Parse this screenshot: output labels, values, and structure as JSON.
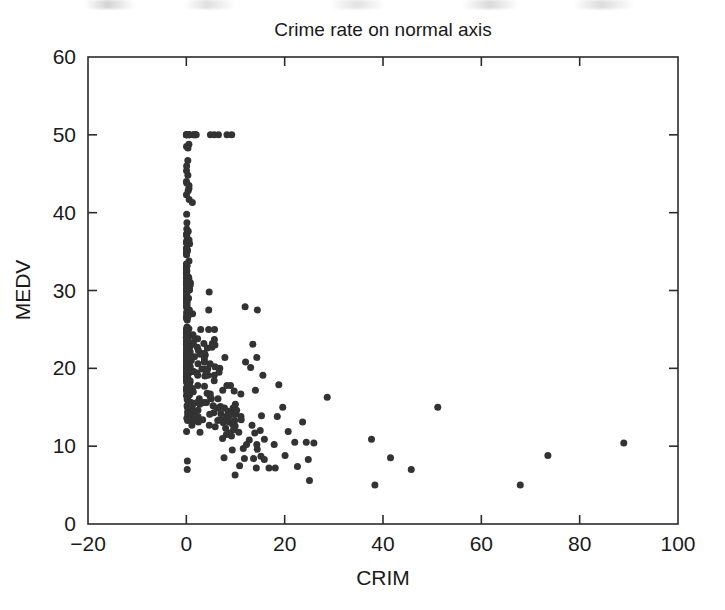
{
  "figure": {
    "name": "crime-rate-scatter-figure",
    "width": 725,
    "height": 610,
    "background": "#ffffff",
    "marker_color": "#333333",
    "axis_color": "#2b2b2b"
  },
  "chart_data": {
    "type": "scatter",
    "title": "Crime rate on normal axis",
    "xlabel": "CRIM",
    "ylabel": "MEDV",
    "xlim": [
      -20,
      100
    ],
    "ylim": [
      0,
      60
    ],
    "xticks": [
      -20,
      0,
      20,
      40,
      60,
      80,
      100
    ],
    "yticks": [
      0,
      10,
      20,
      30,
      40,
      50,
      60
    ],
    "xtick_labels": [
      "−20",
      "0",
      "20",
      "40",
      "60",
      "80",
      "100"
    ],
    "ytick_labels": [
      "0",
      "10",
      "20",
      "30",
      "40",
      "50",
      "60"
    ],
    "grid": false,
    "legend": null,
    "marker": "filled-circle",
    "marker_size_px": 7,
    "n_points": 506,
    "x": [
      0.00632,
      0.02731,
      0.02729,
      0.03237,
      0.06905,
      0.02985,
      0.08829,
      0.14455,
      0.21124,
      0.17004,
      0.22489,
      0.11747,
      0.09378,
      0.62976,
      0.63796,
      0.62739,
      1.05393,
      0.7842,
      0.8027,
      0.7258,
      1.25179,
      0.85204,
      1.23247,
      0.98843,
      0.75026,
      0.84054,
      0.67191,
      0.95577,
      0.77299,
      1.00245,
      1.13081,
      1.35472,
      1.38799,
      1.15172,
      1.61282,
      0.06417,
      0.09744,
      0.08014,
      0.17505,
      0.02763,
      0.03359,
      0.12744,
      0.1415,
      0.15936,
      0.12269,
      0.17142,
      0.18836,
      0.22927,
      0.25387,
      0.21977,
      0.08873,
      0.04337,
      0.0536,
      0.04981,
      0.0136,
      0.01311,
      0.02055,
      0.01432,
      0.15445,
      0.10328,
      0.14932,
      0.17171,
      0.11027,
      0.1265,
      0.01951,
      0.03584,
      0.04379,
      0.05789,
      0.13554,
      0.12816,
      0.08826,
      0.15876,
      0.09164,
      0.19539,
      0.07896,
      0.09512,
      0.10153,
      0.08707,
      0.05646,
      0.08387,
      0.04113,
      0.04462,
      0.03659,
      0.03551,
      0.05059,
      0.05735,
      0.05188,
      0.07151,
      0.0566,
      0.05302,
      0.04684,
      0.03932,
      0.04203,
      0.02875,
      0.04294,
      0.12204,
      0.11504,
      0.12083,
      0.08187,
      0.0686,
      0.14866,
      0.11432,
      0.22876,
      0.21161,
      0.1396,
      0.13262,
      0.1712,
      0.13117,
      0.12802,
      0.26363,
      0.10793,
      0.10084,
      0.12329,
      0.22212,
      0.14231,
      0.17134,
      0.13158,
      0.15098,
      0.13058,
      0.14476,
      0.06899,
      0.07165,
      0.09299,
      0.15038,
      0.09849,
      0.16902,
      0.38735,
      0.25915,
      0.32543,
      0.88125,
      0.34006,
      1.19294,
      0.59005,
      0.32982,
      0.97617,
      0.55778,
      0.32264,
      0.35233,
      0.2498,
      0.54452,
      0.2909,
      1.62864,
      3.32105,
      4.0974,
      2.77974,
      2.37934,
      2.15505,
      2.36862,
      2.33099,
      2.73397,
      1.6566,
      1.49632,
      1.12658,
      2.14918,
      1.41385,
      3.53501,
      2.44668,
      1.22358,
      1.34284,
      1.42502,
      1.27346,
      1.46336,
      1.83377,
      1.51902,
      2.24236,
      2.924,
      2.01019,
      1.80028,
      2.3004,
      2.44953,
      1.20742,
      2.3139,
      0.13914,
      0.09178,
      0.08447,
      0.06664,
      0.07022,
      0.05425,
      0.06642,
      0.0578,
      0.06588,
      0.06888,
      0.09103,
      0.10008,
      0.08308,
      0.06047,
      0.05602,
      0.07875,
      0.12579,
      0.0837,
      0.09068,
      0.06911,
      0.08664,
      0.02187,
      0.01439,
      0.01381,
      0.04011,
      0.04666,
      0.03768,
      0.0315,
      0.01778,
      0.03445,
      0.02177,
      0.0351,
      0.02009,
      0.13642,
      0.22969,
      0.25199,
      0.13587,
      0.43571,
      0.17446,
      0.37578,
      0.21719,
      0.14052,
      0.28955,
      0.19802,
      0.0456,
      0.07013,
      0.11069,
      0.11425,
      0.35809,
      0.40771,
      0.62356,
      0.6147,
      0.31533,
      0.52693,
      0.38214,
      0.41238,
      0.29819,
      0.44178,
      0.537,
      0.46296,
      0.57529,
      0.33147,
      0.44791,
      0.33045,
      0.52058,
      0.51183,
      0.08244,
      0.09252,
      0.11329,
      0.10612,
      0.1029,
      0.12757,
      0.20608,
      0.19133,
      0.33983,
      0.19657,
      0.16439,
      0.19073,
      0.1403,
      0.21409,
      0.08221,
      0.36894,
      0.04819,
      0.03548,
      0.01538,
      0.61154,
      0.66351,
      0.65665,
      0.54011,
      0.53412,
      0.52014,
      0.82526,
      0.55007,
      0.76162,
      0.7857,
      0.57834,
      0.5405,
      0.09065,
      0.29916,
      0.16211,
      0.1146,
      0.22188,
      0.05644,
      0.09604,
      0.10469,
      0.06127,
      0.07978,
      0.21038,
      0.03578,
      0.03705,
      0.06129,
      0.01501,
      0.00906,
      0.01096,
      0.01965,
      0.03871,
      0.0459,
      0.04297,
      0.03502,
      0.07886,
      0.03615,
      0.08265,
      0.08199,
      0.12932,
      0.05372,
      0.14103,
      0.06466,
      0.05561,
      0.04417,
      0.03537,
      0.09266,
      0.1,
      0.05515,
      0.05479,
      0.07503,
      0.04932,
      0.49298,
      0.3494,
      2.63548,
      0.79041,
      0.26169,
      0.26938,
      0.3692,
      0.25356,
      0.31827,
      0.24522,
      0.40202,
      0.47547,
      0.1676,
      0.18159,
      0.35114,
      0.28392,
      0.34109,
      0.19186,
      0.30347,
      0.24103,
      0.06617,
      0.06724,
      0.04544,
      0.05023,
      0.03466,
      0.05083,
      0.03738,
      0.03961,
      0.03427,
      0.03041,
      0.03306,
      0.05497,
      0.06151,
      0.01301,
      0.02498,
      0.02543,
      0.03049,
      0.03113,
      0.06162,
      0.0187,
      0.01501,
      0.02899,
      0.06211,
      0.0795,
      0.07244,
      0.01709,
      0.04301,
      0.10659,
      8.98296,
      3.8497,
      5.20177,
      4.26131,
      4.54192,
      3.83684,
      3.67822,
      4.22239,
      3.47428,
      4.55587,
      3.69695,
      13.5222,
      4.89822,
      5.66998,
      6.53876,
      9.2323,
      8.26725,
      11.1081,
      18.4982,
      19.6091,
      15.288,
      9.82349,
      23.6482,
      17.8667,
      88.9762,
      15.8744,
      9.18702,
      7.99248,
      20.0849,
      16.8118,
      24.3938,
      22.5971,
      14.3337,
      8.15174,
      6.96215,
      5.29305,
      11.5779,
      8.64476,
      13.3598,
      8.71675,
      5.87205,
      7.67202,
      38.3518,
      9.91655,
      25.0461,
      14.2362,
      9.59571,
      24.8017,
      41.5292,
      67.9208,
      20.7162,
      11.9511,
      7.40389,
      14.4383,
      51.1358,
      14.0507,
      18.811,
      28.6558,
      45.7461,
      18.0846,
      10.8342,
      25.9406,
      73.5341,
      11.8123,
      11.0874,
      7.02259,
      12.0482,
      7.05042,
      8.79212,
      15.8603,
      12.2472,
      37.6619,
      7.36711,
      9.33889,
      8.49213,
      10.0623,
      6.44405,
      5.58107,
      13.9134,
      11.1604,
      14.4208,
      15.1772,
      13.6781,
      9.39063,
      22.0511,
      9.72418,
      5.66637,
      9.96654,
      12.8023,
      10.6718,
      6.28807,
      9.92485,
      9.32909,
      7.52601,
      6.71772,
      5.44114,
      5.09017,
      8.24809,
      9.51363,
      4.75237,
      4.66883,
      8.20058,
      7.75223,
      6.80117,
      4.81213,
      3.69311,
      6.65492,
      5.82115,
      7.83932,
      3.1636,
      3.77498,
      4.42228,
      15.5757,
      13.0751,
      4.34879,
      4.03841,
      3.56868,
      4.64689,
      8.05579,
      6.39312,
      4.87141,
      15.0234,
      10.233,
      14.3337,
      5.82401,
      5.70818,
      5.73116,
      2.81838,
      2.37857,
      3.67367,
      5.69175,
      4.83567,
      0.15086,
      0.18337,
      0.20746,
      0.10574,
      0.11132,
      0.17331,
      0.27957,
      0.17899,
      0.2896,
      0.26838,
      0.23912,
      0.17783,
      0.22438,
      0.06263,
      0.04527,
      0.06076,
      0.10959,
      0.04741
    ],
    "y": [
      24.0,
      21.6,
      34.7,
      33.4,
      36.2,
      28.7,
      22.9,
      27.1,
      16.5,
      18.9,
      15.0,
      18.9,
      21.7,
      20.4,
      18.2,
      19.9,
      23.1,
      17.5,
      20.2,
      18.2,
      13.6,
      19.6,
      15.2,
      14.5,
      15.6,
      13.9,
      16.6,
      14.8,
      18.4,
      21.0,
      12.7,
      14.5,
      13.2,
      13.1,
      13.5,
      18.9,
      20.0,
      21.0,
      24.7,
      30.8,
      34.9,
      26.6,
      25.3,
      24.7,
      21.2,
      19.3,
      20.0,
      16.6,
      14.4,
      19.4,
      19.7,
      20.5,
      25.0,
      23.4,
      18.9,
      35.4,
      24.7,
      31.6,
      23.3,
      19.6,
      18.7,
      16.0,
      22.2,
      25.0,
      33.0,
      23.5,
      19.4,
      22.0,
      17.4,
      20.9,
      24.2,
      21.7,
      22.8,
      23.4,
      24.1,
      21.4,
      20.0,
      20.8,
      21.2,
      20.3,
      28.0,
      23.9,
      24.8,
      22.9,
      23.9,
      26.6,
      22.5,
      22.2,
      23.6,
      28.7,
      22.6,
      22.0,
      22.9,
      25.0,
      20.6,
      28.4,
      21.4,
      38.7,
      43.8,
      33.2,
      27.5,
      26.5,
      18.6,
      19.3,
      20.1,
      19.5,
      19.5,
      20.4,
      19.8,
      19.4,
      21.7,
      22.8,
      18.8,
      18.7,
      18.5,
      18.3,
      21.2,
      19.2,
      20.4,
      19.3,
      22.0,
      20.3,
      20.5,
      17.3,
      18.8,
      21.4,
      15.7,
      16.2,
      18.0,
      14.3,
      19.2,
      19.6,
      23.0,
      18.4,
      15.6,
      18.1,
      17.4,
      17.1,
      13.3,
      17.8,
      14.0,
      14.4,
      13.4,
      15.6,
      11.8,
      13.8,
      15.6,
      14.6,
      17.8,
      15.4,
      21.5,
      19.6,
      15.3,
      19.4,
      17.0,
      15.6,
      13.1,
      41.3,
      24.3,
      23.3,
      27.0,
      50.0,
      50.0,
      50.0,
      22.7,
      25.0,
      50.0,
      23.8,
      23.8,
      22.3,
      17.4,
      19.1,
      23.1,
      23.6,
      22.6,
      29.4,
      23.2,
      24.6,
      29.9,
      37.2,
      39.8,
      36.2,
      37.9,
      32.5,
      26.4,
      29.6,
      50.0,
      32.0,
      29.8,
      34.9,
      37.0,
      30.5,
      36.4,
      31.1,
      29.1,
      50.0,
      33.3,
      30.3,
      34.6,
      34.9,
      32.9,
      24.1,
      42.3,
      48.5,
      50.0,
      22.6,
      24.4,
      22.5,
      24.4,
      20.0,
      21.7,
      19.3,
      22.4,
      28.1,
      23.7,
      25.0,
      23.3,
      28.7,
      21.5,
      23.0,
      26.7,
      21.7,
      27.5,
      30.1,
      44.8,
      50.0,
      37.6,
      31.6,
      46.7,
      31.5,
      24.3,
      31.7,
      41.7,
      48.3,
      29.0,
      24.0,
      25.1,
      31.5,
      23.7,
      23.3,
      22.0,
      20.1,
      22.2,
      23.7,
      17.6,
      18.5,
      24.3,
      20.5,
      24.5,
      26.2,
      24.4,
      24.8,
      29.6,
      42.8,
      21.9,
      20.9,
      44.0,
      50.0,
      36.0,
      30.1,
      33.8,
      43.1,
      48.8,
      31.0,
      36.5,
      22.8,
      30.7,
      50.0,
      43.5,
      20.7,
      21.1,
      25.2,
      24.4,
      35.2,
      32.4,
      32.0,
      33.2,
      33.1,
      29.1,
      35.1,
      45.4,
      35.4,
      46.0,
      50.0,
      32.2,
      22.0,
      20.1,
      23.2,
      22.3,
      24.8,
      28.5,
      37.3,
      27.9,
      23.9,
      21.7,
      28.6,
      27.1,
      20.3,
      22.5,
      29.0,
      24.8,
      22.0,
      26.4,
      33.1,
      36.1,
      28.4,
      33.4,
      28.2,
      22.8,
      20.3,
      16.1,
      22.1,
      19.4,
      21.6,
      23.8,
      16.2,
      17.8,
      19.8,
      23.1,
      21.0,
      23.8,
      23.1,
      20.4,
      18.5,
      25.0,
      24.6,
      23.0,
      22.2,
      19.3,
      22.6,
      19.8,
      17.1,
      19.4,
      22.2,
      20.7,
      21.1,
      19.5,
      18.5,
      20.6,
      19.0,
      18.7,
      32.7,
      16.5,
      23.9,
      31.2,
      17.5,
      17.2,
      23.1,
      24.5,
      26.6,
      22.9,
      24.1,
      18.6,
      30.1,
      18.2,
      20.6,
      17.8,
      21.7,
      22.7,
      22.6,
      25.0,
      19.9,
      20.8,
      16.8,
      21.9,
      27.5,
      21.9,
      23.1,
      50.0,
      50.0,
      50.0,
      50.0,
      50.0,
      13.8,
      13.8,
      15.0,
      13.9,
      13.3,
      13.1,
      10.2,
      10.4,
      10.9,
      11.3,
      12.3,
      8.8,
      7.2,
      10.5,
      7.4,
      10.2,
      11.5,
      15.1,
      23.2,
      9.7,
      13.8,
      12.7,
      13.1,
      12.5,
      8.5,
      5.0,
      6.3,
      5.6,
      7.2,
      12.1,
      8.3,
      8.5,
      5.0,
      11.9,
      27.9,
      17.2,
      27.5,
      15.0,
      17.2,
      17.9,
      16.3,
      7.0,
      7.2,
      7.5,
      10.4,
      8.8,
      8.4,
      16.7,
      14.2,
      20.8,
      13.4,
      11.7,
      8.3,
      10.2,
      10.9,
      11.0,
      9.5,
      14.5,
      14.1,
      16.1,
      14.3,
      11.7,
      13.4,
      9.6,
      8.7,
      8.4,
      12.8,
      10.5,
      17.1,
      18.4,
      15.4,
      10.8,
      11.8,
      14.9,
      12.6,
      14.1,
      13.0,
      13.4,
      15.2,
      16.1,
      17.8,
      14.9,
      14.1,
      12.7,
      13.5,
      14.9,
      20.0,
      16.4,
      17.7,
      19.5,
      20.2,
      21.4,
      19.9,
      19.0,
      19.1,
      19.1,
      20.1,
      19.9,
      19.6,
      23.2,
      29.8,
      13.8,
      13.3,
      16.7,
      12.0,
      14.6,
      21.4,
      23.0,
      23.7,
      25.0,
      21.8,
      20.6,
      21.2,
      19.1,
      20.6,
      15.2,
      7.0,
      8.1,
      13.6,
      20.1,
      21.8,
      24.5,
      23.1,
      19.7,
      18.3,
      21.2,
      17.5,
      16.8,
      22.4,
      20.6,
      23.9,
      22.0,
      11.9
    ]
  }
}
